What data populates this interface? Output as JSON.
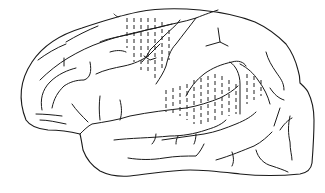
{
  "figure": {
    "description": "Line drawing of the left hemisphere of a brain with two hatched (dashed-line) regions",
    "stroke_color": "#1a1a1a",
    "background_color": "#ffffff",
    "regions": [
      {
        "name": "frontal-hatched-region",
        "label": ""
      },
      {
        "name": "temporo-parietal-hatched-region",
        "label": ""
      }
    ]
  }
}
